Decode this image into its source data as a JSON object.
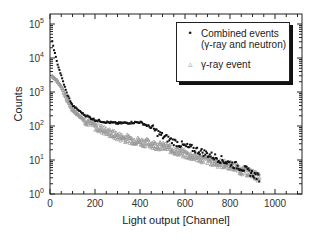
{
  "chart_data": {
    "type": "scatter",
    "title": "",
    "xlabel": "Light output [Channel]",
    "ylabel": "Counts",
    "xlim": [
      0,
      1120
    ],
    "ylim": [
      1,
      100000
    ],
    "yscale": "log",
    "grid": false,
    "legend_position": "upper right",
    "x_ticks": [
      "0",
      "200",
      "400",
      "600",
      "800",
      "1000"
    ],
    "y_ticks": [
      "10^0",
      "10^1",
      "10^2",
      "10^3",
      "10^4",
      "10^5"
    ],
    "x": [
      10,
      30,
      50,
      75,
      100,
      150,
      200,
      250,
      300,
      350,
      400,
      450,
      500,
      550,
      600,
      650,
      700,
      750,
      800,
      850,
      900,
      930
    ],
    "series": [
      {
        "name": "Combined events (γ-ray and neutron)",
        "marker": "filled-circle",
        "color": "#111111",
        "values": [
          30000,
          8000,
          3000,
          900,
          400,
          220,
          150,
          130,
          120,
          125,
          130,
          90,
          50,
          35,
          25,
          20,
          15,
          11,
          8,
          6,
          4,
          3
        ]
      },
      {
        "name": "γ-ray event",
        "marker": "open-triangle",
        "color": "#9a9a9a",
        "values": [
          3000,
          2200,
          1500,
          600,
          300,
          160,
          100,
          70,
          50,
          42,
          35,
          30,
          25,
          20,
          15,
          12,
          10,
          8,
          7,
          5,
          4,
          3
        ]
      }
    ]
  },
  "axes": {
    "xlabel": "Light output [Channel]",
    "ylabel": "Counts",
    "x_ticks": [
      {
        "label": "0",
        "value": 0
      },
      {
        "label": "200",
        "value": 200
      },
      {
        "label": "400",
        "value": 400
      },
      {
        "label": "600",
        "value": 600
      },
      {
        "label": "800",
        "value": 800
      },
      {
        "label": "1000",
        "value": 1000
      }
    ],
    "y_ticks": [
      {
        "base": "10",
        "exp": "0",
        "value": 1
      },
      {
        "base": "10",
        "exp": "1",
        "value": 10
      },
      {
        "base": "10",
        "exp": "2",
        "value": 100
      },
      {
        "base": "10",
        "exp": "3",
        "value": 1000
      },
      {
        "base": "10",
        "exp": "4",
        "value": 10000
      },
      {
        "base": "10",
        "exp": "5",
        "value": 100000
      }
    ]
  },
  "legend": {
    "items": [
      {
        "line1": "Combined events",
        "line2": "(γ-ray and neutron)",
        "marker": "•"
      },
      {
        "line1": "γ-ray event",
        "line2": "",
        "marker": "▵"
      }
    ]
  }
}
